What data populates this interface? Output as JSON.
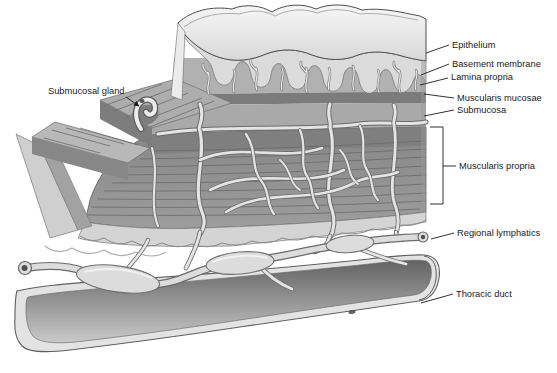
{
  "diagram": {
    "labels": {
      "submucosal_gland": "Submucosal gland",
      "epithelium": "Epithelium",
      "basement_membrane": "Basement membrane",
      "lamina_propria": "Lamina propria",
      "muscularis_mucosae": "Muscularis mucosae",
      "submucosa": "Submucosa",
      "muscularis_propria": "Muscularis propria",
      "regional_lymphatics": "Regional lymphatics",
      "thoracic_duct": "Thoracic duct"
    },
    "palette": {
      "background": "#ffffff",
      "ink": "#1b1b1b",
      "epithelium_top": "#f2f2f2",
      "epithelium_front": "#dbdbdb",
      "lamina_propria": "#b1b1b1",
      "muscularis_mucosae": "#7b7b7b",
      "submucosa": "#a9a9a9",
      "muscularis_propria": "#8e8e8e",
      "vessel_light": "#e4e4e4",
      "vessel_outline": "#6b6b6b",
      "duct_wall": "#e3e3e3",
      "duct_lumen_dark": "#6a6a6a"
    }
  }
}
